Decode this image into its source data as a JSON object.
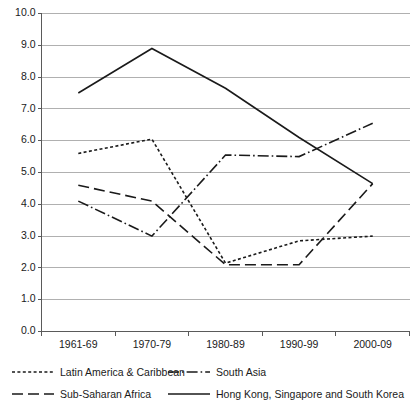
{
  "chart_data": {
    "type": "line",
    "title": "",
    "subtitle": "",
    "xlabel": "",
    "ylabel": "",
    "categories": [
      "1961-69",
      "1970-79",
      "1980-89",
      "1990-99",
      "2000-09"
    ],
    "ylim": [
      0.0,
      10.0
    ],
    "ytick_labels": [
      "0.0",
      "1.0",
      "2.0",
      "3.0",
      "4.0",
      "5.0",
      "6.0",
      "7.0",
      "8.0",
      "9.0",
      "10.0"
    ],
    "ytick_values": [
      0.0,
      1.0,
      2.0,
      3.0,
      4.0,
      5.0,
      6.0,
      7.0,
      8.0,
      9.0,
      10.0
    ],
    "grid": true,
    "grid_axis": "y",
    "legend_position": "bottom",
    "series": [
      {
        "name": "Latin America & Caribbean",
        "style": "dotted",
        "dasharray": "3,2.4",
        "color": "#1a1a1a",
        "values": [
          5.6,
          6.05,
          2.15,
          2.85,
          3.0
        ]
      },
      {
        "name": "South Asia",
        "style": "dash-dot",
        "dasharray": "11,3,1.6,3",
        "color": "#1a1a1a",
        "values": [
          4.1,
          3.0,
          5.55,
          5.5,
          6.55
        ]
      },
      {
        "name": "Sub-Saharan Africa",
        "style": "dashed",
        "dasharray": "11,5",
        "color": "#1a1a1a",
        "values": [
          4.6,
          4.1,
          2.1,
          2.1,
          4.65
        ]
      },
      {
        "name": "Hong Kong, Singapore and South Korea",
        "style": "solid",
        "dasharray": "none",
        "color": "#1a1a1a",
        "values": [
          7.5,
          8.9,
          7.65,
          6.1,
          4.65
        ]
      }
    ]
  },
  "legend": {
    "rows": [
      {
        "left_series_index": 0,
        "right_series_index": 1
      },
      {
        "left_series_index": 2,
        "right_series_index": 3
      }
    ]
  },
  "axis": {
    "y_axis_name": "value-axis",
    "x_axis_name": "period-axis"
  }
}
